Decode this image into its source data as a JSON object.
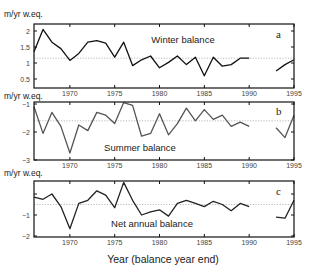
{
  "chart_data": [
    {
      "type": "line",
      "panel_label": "a",
      "title": "Winter balance",
      "ylabel": "m/yr w.eq.",
      "xlabel": "Year (balance year end)",
      "xlim": [
        1966,
        1995
      ],
      "ylim": [
        0.45,
        2.2
      ],
      "yticks": [
        0.5,
        1,
        1.5,
        2
      ],
      "ytick_labels": [
        "0.5",
        "1",
        "1.5",
        "2"
      ],
      "xticks": [
        1970,
        1975,
        1980,
        1985,
        1990,
        1995
      ],
      "mean_line": 1.15,
      "grid": false,
      "x": [
        1966,
        1967,
        1968,
        1969,
        1970,
        1971,
        1972,
        1973,
        1974,
        1975,
        1976,
        1977,
        1978,
        1979,
        1980,
        1981,
        1982,
        1983,
        1984,
        1985,
        1986,
        1987,
        1988,
        1989,
        1990,
        1991,
        1992,
        1993,
        1994,
        1995
      ],
      "values": [
        1.35,
        2.05,
        1.65,
        1.45,
        1.08,
        1.3,
        1.65,
        1.7,
        1.62,
        1.18,
        1.65,
        0.92,
        1.1,
        1.22,
        0.85,
        1.02,
        1.22,
        0.95,
        1.18,
        0.6,
        1.18,
        0.9,
        0.95,
        1.15,
        1.15,
        null,
        null,
        0.75,
        0.95,
        1.1
      ]
    },
    {
      "type": "line",
      "panel_label": "b",
      "title": "Summer balance",
      "ylabel": "m/yr w.eq.",
      "xlabel": "Year (balance year end)",
      "xlim": [
        1966,
        1995
      ],
      "ylim": [
        -3,
        -0.95
      ],
      "yticks": [
        -3,
        -2,
        -1
      ],
      "ytick_labels": [
        "−3",
        "−2",
        "−1"
      ],
      "xticks": [
        1970,
        1975,
        1980,
        1985,
        1990,
        1995
      ],
      "mean_line": -1.6,
      "grid": false,
      "x": [
        1966,
        1967,
        1968,
        1969,
        1970,
        1971,
        1972,
        1973,
        1974,
        1975,
        1976,
        1977,
        1978,
        1979,
        1980,
        1981,
        1982,
        1983,
        1984,
        1985,
        1986,
        1987,
        1988,
        1989,
        1990,
        1991,
        1992,
        1993,
        1994,
        1995
      ],
      "values": [
        -1.1,
        -2.05,
        -1.3,
        -1.8,
        -2.75,
        -1.75,
        -1.95,
        -1.3,
        -1.4,
        -1.7,
        -0.95,
        -1.05,
        -2.15,
        -2.05,
        -1.35,
        -2.1,
        -1.7,
        -1.15,
        -1.6,
        -1.2,
        -1.55,
        -1.4,
        -1.8,
        -1.65,
        -1.8,
        null,
        null,
        -1.85,
        -2.2,
        -1.4
      ]
    },
    {
      "type": "line",
      "panel_label": "c",
      "title": "Net annual balance",
      "ylabel": "m/yr w.eq.",
      "xlabel": "Year (balance year end)",
      "xlim": [
        1966,
        1995
      ],
      "ylim": [
        -2,
        0.65
      ],
      "yticks": [
        -2,
        -1,
        0
      ],
      "ytick_labels": [
        "−2",
        "−1",
        ""
      ],
      "xticks": [
        1970,
        1975,
        1980,
        1985,
        1990,
        1995
      ],
      "mean_line": -0.5,
      "grid": false,
      "x": [
        1966,
        1967,
        1968,
        1969,
        1970,
        1971,
        1972,
        1973,
        1974,
        1975,
        1976,
        1977,
        1978,
        1979,
        1980,
        1981,
        1982,
        1983,
        1984,
        1985,
        1986,
        1987,
        1988,
        1989,
        1990,
        1991,
        1992,
        1993,
        1994,
        1995
      ],
      "values": [
        -0.15,
        -0.25,
        0.0,
        -0.6,
        -1.65,
        -0.45,
        -0.3,
        0.15,
        -0.05,
        -0.65,
        0.55,
        -0.3,
        -1.0,
        -0.85,
        -0.75,
        -1.05,
        -0.45,
        -0.3,
        -0.45,
        -0.6,
        -0.35,
        -0.5,
        -0.8,
        -0.45,
        -0.6,
        null,
        null,
        -1.1,
        -1.15,
        -0.3
      ]
    }
  ],
  "figure": {
    "xlabel": "Year (balance year end)",
    "unit_label": "m/yr w.eq.",
    "panels": [
      {
        "label": "a",
        "title": "Winter balance",
        "line_color": "#111111"
      },
      {
        "label": "b",
        "title": "Summer balance",
        "line_color": "#555555"
      },
      {
        "label": "c",
        "title": "Net annual balance",
        "line_color": "#222222"
      }
    ],
    "colors": {
      "axis": "#111111",
      "mean_line": "#aaaaaa",
      "tick_text": "#444444"
    }
  }
}
